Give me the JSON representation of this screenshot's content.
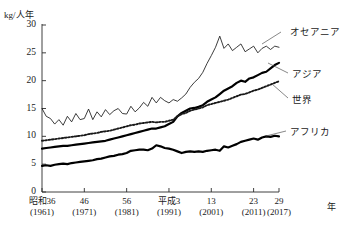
{
  "chart_data": {
    "type": "line",
    "title": "",
    "ylabel": "kg/人年",
    "xlabel": "年",
    "ylim": [
      0,
      30
    ],
    "yticks": [
      0,
      5,
      10,
      15,
      20,
      25,
      30
    ],
    "grid": false,
    "legend_position": "inline-right",
    "xlim": [
      1961,
      2017
    ],
    "xticks": [
      {
        "era": "昭和36",
        "year": "(1961)",
        "value": 1961
      },
      {
        "era": "46",
        "year": "(1971)",
        "value": 1971
      },
      {
        "era": "56",
        "year": "(1981)",
        "value": 1981
      },
      {
        "era": "平成3",
        "year": "(1991)",
        "value": 1991
      },
      {
        "era": "13",
        "year": "(2001)",
        "value": 2001
      },
      {
        "era": "23",
        "year": "(2011)",
        "value": 2011
      },
      {
        "era": "29",
        "year": "(2017)",
        "value": 2017
      }
    ],
    "x": [
      1961,
      1962,
      1963,
      1964,
      1965,
      1966,
      1967,
      1968,
      1969,
      1970,
      1971,
      1972,
      1973,
      1974,
      1975,
      1976,
      1977,
      1978,
      1979,
      1980,
      1981,
      1982,
      1983,
      1984,
      1985,
      1986,
      1987,
      1988,
      1989,
      1990,
      1991,
      1992,
      1993,
      1994,
      1995,
      1996,
      1997,
      1998,
      1999,
      2000,
      2001,
      2002,
      2003,
      2004,
      2005,
      2006,
      2007,
      2008,
      2009,
      2010,
      2011,
      2012,
      2013,
      2014,
      2015,
      2016,
      2017
    ],
    "series": [
      {
        "name": "オセアニア",
        "style": "thin-solid",
        "color": "#1a1a1a",
        "values": [
          15.0,
          13.6,
          13.2,
          12.2,
          13.0,
          12.0,
          13.6,
          12.6,
          14.1,
          13.0,
          13.2,
          14.9,
          13.0,
          14.4,
          13.5,
          14.8,
          13.9,
          14.6,
          15.0,
          14.1,
          14.0,
          15.4,
          14.4,
          15.1,
          16.1,
          15.4,
          17.0,
          16.0,
          17.0,
          16.4,
          16.0,
          16.6,
          16.3,
          16.9,
          17.6,
          18.8,
          19.7,
          20.4,
          21.5,
          23.1,
          24.5,
          26.0,
          28.0,
          25.8,
          26.6,
          25.4,
          26.0,
          26.6,
          25.2,
          25.7,
          26.2,
          25.0,
          25.8,
          26.2,
          25.6,
          26.2,
          26.0
        ]
      },
      {
        "name": "アジア",
        "style": "thick-solid",
        "color": "#000000",
        "values": [
          7.8,
          7.9,
          8.0,
          8.1,
          8.2,
          8.3,
          8.3,
          8.4,
          8.5,
          8.6,
          8.7,
          8.8,
          8.9,
          9.0,
          9.1,
          9.2,
          9.4,
          9.6,
          9.8,
          10.0,
          10.2,
          10.4,
          10.6,
          10.8,
          11.0,
          11.2,
          11.4,
          11.4,
          11.6,
          11.8,
          12.2,
          12.6,
          13.6,
          14.2,
          14.6,
          15.0,
          15.1,
          15.3,
          15.6,
          16.2,
          16.6,
          17.0,
          17.6,
          18.2,
          18.6,
          19.0,
          19.6,
          20.0,
          19.8,
          20.4,
          20.6,
          21.0,
          21.4,
          21.6,
          22.2,
          22.8,
          23.2
        ]
      },
      {
        "name": "世界",
        "style": "dotted",
        "color": "#1a1a1a",
        "values": [
          9.2,
          9.3,
          9.4,
          9.5,
          9.6,
          9.7,
          9.8,
          9.9,
          10.0,
          10.1,
          10.2,
          10.4,
          10.5,
          10.6,
          10.8,
          10.9,
          11.0,
          11.2,
          11.4,
          11.6,
          11.8,
          12.0,
          12.1,
          12.3,
          12.4,
          12.5,
          12.6,
          12.5,
          12.6,
          12.6,
          12.8,
          13.0,
          13.6,
          14.0,
          14.2,
          14.6,
          14.8,
          15.0,
          15.2,
          15.6,
          15.8,
          16.0,
          16.2,
          16.4,
          16.6,
          16.9,
          17.2,
          17.5,
          17.6,
          17.9,
          18.2,
          18.4,
          18.7,
          19.0,
          19.3,
          19.6,
          19.9
        ]
      },
      {
        "name": "アフリカ",
        "style": "thick-solid",
        "color": "#000000",
        "values": [
          4.7,
          4.8,
          4.7,
          4.9,
          5.0,
          5.1,
          5.0,
          5.2,
          5.3,
          5.4,
          5.5,
          5.6,
          5.7,
          5.9,
          6.0,
          6.2,
          6.4,
          6.5,
          6.7,
          6.8,
          7.0,
          7.4,
          7.5,
          7.6,
          7.6,
          7.5,
          7.8,
          8.4,
          8.2,
          7.9,
          7.8,
          7.6,
          7.3,
          7.0,
          7.2,
          7.3,
          7.2,
          7.3,
          7.2,
          7.4,
          7.5,
          7.6,
          7.4,
          8.2,
          8.0,
          8.3,
          8.6,
          9.0,
          9.2,
          9.4,
          9.6,
          9.4,
          9.8,
          10.0,
          9.9,
          10.1,
          10.0
        ]
      }
    ]
  }
}
